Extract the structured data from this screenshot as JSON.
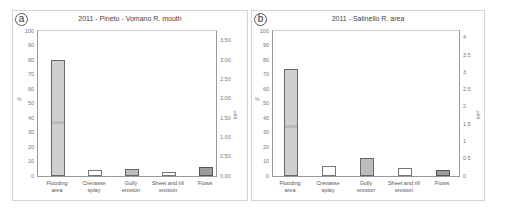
{
  "chart_data": [
    {
      "panel": "a",
      "type": "bar",
      "title": "2011 - Pineto - Vomano R. mouth",
      "categories": [
        "Flooding area",
        "Crevasse splay",
        "Gully erosion",
        "Sheet and rill erosion",
        "Flows"
      ],
      "values": [
        80,
        4.4,
        5,
        3,
        6
      ],
      "ylabel": "%",
      "ylabel_right": "km²",
      "ylim": [
        0,
        100
      ],
      "yticks": [
        "0",
        "10",
        "20",
        "30",
        "40",
        "50",
        "60",
        "70",
        "80",
        "90",
        "100"
      ],
      "yticks_right": [
        "0.00",
        "0.50",
        "1.00",
        "1.50",
        "2.00",
        "2.50",
        "3.00",
        "3.50"
      ],
      "grid": false,
      "bar_styles": [
        "stipple",
        "white",
        "mid",
        "white",
        "dark"
      ]
    },
    {
      "panel": "b",
      "type": "bar",
      "title": "2011 - Salinello R. area",
      "categories": [
        "Flooding area",
        "Crevasse splay",
        "Gully erosion",
        "Sheet and rill erosion",
        "Flows"
      ],
      "values": [
        74,
        6.8,
        12.5,
        5.7,
        4.5
      ],
      "ylabel": "%",
      "ylabel_right": "km²",
      "ylim": [
        0,
        100
      ],
      "yticks": [
        "0",
        "10",
        "20",
        "30",
        "40",
        "50",
        "60",
        "70",
        "80",
        "90",
        "100"
      ],
      "yticks_right": [
        "0",
        "0.5",
        "1",
        "1.5",
        "2",
        "2.5",
        "3",
        "3.5",
        "4"
      ],
      "grid": false,
      "bar_styles": [
        "stipple",
        "white",
        "mid",
        "white",
        "dark"
      ]
    }
  ],
  "panels": {
    "a": {
      "badge": "a",
      "title": "2011 - Pineto - Vomano R. mouth",
      "ylabel": "%",
      "rlabel": "km²",
      "xlabels": [
        [
          "Flooding",
          "area"
        ],
        [
          "Crevasse",
          "splay"
        ],
        [
          "Gully",
          "erosion"
        ],
        [
          "Sheet and rill",
          "erosion"
        ],
        [
          "Flows",
          ""
        ]
      ]
    },
    "b": {
      "badge": "b",
      "title": "2011 - Salinello R. area",
      "ylabel": "%",
      "rlabel": "km²",
      "xlabels": [
        [
          "Flooding",
          "area"
        ],
        [
          "Crevasse",
          "splay"
        ],
        [
          "Gully",
          "erosion"
        ],
        [
          "Sheet and rill",
          "erosion"
        ],
        [
          "Flows",
          ""
        ]
      ]
    }
  }
}
